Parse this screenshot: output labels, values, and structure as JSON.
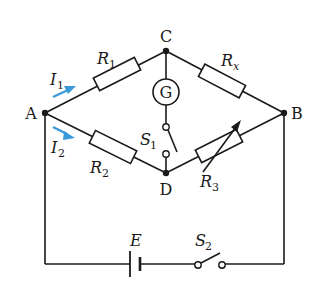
{
  "diagram": {
    "type": "wheatstone-bridge-circuit",
    "nodes": {
      "A": {
        "label": "A"
      },
      "B": {
        "label": "B"
      },
      "C": {
        "label": "C"
      },
      "D": {
        "label": "D"
      }
    },
    "components": {
      "R1": {
        "label": "R",
        "sub": "1"
      },
      "R2": {
        "label": "R",
        "sub": "2"
      },
      "Rx": {
        "label": "R",
        "sub": "x"
      },
      "R3": {
        "label": "R",
        "sub": "3"
      },
      "galvanometer": {
        "label": "G"
      },
      "S1": {
        "label": "S",
        "sub": "1"
      },
      "S2": {
        "label": "S",
        "sub": "2"
      },
      "battery": {
        "label": "E"
      }
    },
    "currents": {
      "I1": {
        "label": "I",
        "sub": "1"
      },
      "I2": {
        "label": "I",
        "sub": "2"
      }
    },
    "colors": {
      "wire": "#1a1a1a",
      "arrow": "#3a9ad9"
    }
  }
}
